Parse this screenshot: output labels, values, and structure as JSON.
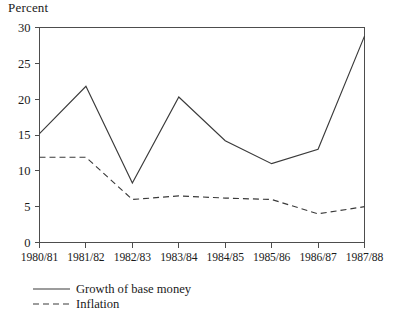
{
  "chart_data": {
    "type": "line",
    "title": "",
    "xlabel": "",
    "ylabel": "Percent",
    "ylim": [
      0,
      30
    ],
    "ytick_values": [
      0,
      5,
      10,
      15,
      20,
      25,
      30
    ],
    "ytick_labels": [
      "0",
      "5",
      "10",
      "15",
      "20",
      "25",
      "30"
    ],
    "grid": false,
    "legend_position": "below-axis-left",
    "categories": [
      "1980/81",
      "1981/82",
      "1982/83",
      "1983/84",
      "1984/85",
      "1985/86",
      "1986/87",
      "1987/88"
    ],
    "series": [
      {
        "name": "Growth of base money",
        "style": "solid",
        "color": "#3a3a3a",
        "values": [
          15.2,
          21.8,
          8.3,
          20.3,
          14.2,
          11.0,
          13.0,
          28.8
        ]
      },
      {
        "name": "Inflation",
        "style": "dashed",
        "color": "#3a3a3a",
        "values": [
          11.9,
          11.9,
          6.0,
          6.5,
          6.2,
          6.0,
          4.0,
          5.0
        ]
      }
    ]
  },
  "axis": {
    "unit_label": "Percent"
  },
  "legend": {
    "entries": [
      {
        "label": "Growth of base money"
      },
      {
        "label": "Inflation"
      }
    ]
  }
}
